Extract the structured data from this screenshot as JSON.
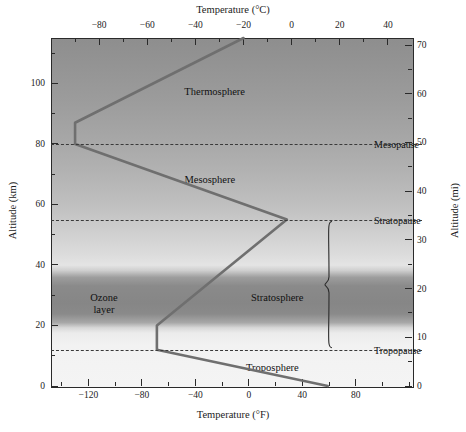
{
  "axes": {
    "top_title": "Temperature (°C)",
    "bottom_title": "Temperature (°F)",
    "left_title": "Altitude (km)",
    "right_title": "Altitude (mi)"
  },
  "ticks": {
    "top_celsius": [
      "−80",
      "−60",
      "−40",
      "−20",
      "0",
      "20",
      "40"
    ],
    "bottom_fahrenheit": [
      "−120",
      "−80",
      "−40",
      "0",
      "40",
      "80"
    ],
    "left_km": [
      "0",
      "20",
      "40",
      "60",
      "80",
      "100"
    ],
    "right_mi": [
      "0",
      "10",
      "20",
      "30",
      "40",
      "50",
      "60",
      "70"
    ]
  },
  "layers": [
    {
      "name": "Thermosphere"
    },
    {
      "name": "Mesosphere"
    },
    {
      "name": "Stratosphere"
    },
    {
      "name": "Troposphere"
    },
    {
      "name": "Ozone",
      "name2": "layer"
    }
  ],
  "boundaries": [
    {
      "name": "Mesopause",
      "altitude_km": 80
    },
    {
      "name": "Stratopause",
      "altitude_km": 55
    },
    {
      "name": "Tropopause",
      "altitude_km": 12
    }
  ],
  "chart_data": {
    "type": "line",
    "xlabel": "Temperature (°C)",
    "ylabel": "Altitude (km)",
    "xlabel_secondary": "Temperature (°F)",
    "ylabel_secondary": "Altitude (mi)",
    "xlim": [
      -100,
      50
    ],
    "ylim": [
      0,
      115
    ],
    "xlim_fahrenheit": [
      -148,
      122
    ],
    "ylim_mi": [
      0,
      71.5
    ],
    "grid": false,
    "legend": "none",
    "series": [
      {
        "name": "Temperature profile",
        "color": "#6f6f6f",
        "x": [
          15,
          -56,
          -56,
          -2,
          -90,
          -90,
          -20
        ],
        "y": [
          0,
          12,
          20,
          55,
          80,
          87,
          115
        ],
        "points_label": [
          "surface 15 °C at 0 km",
          "tropopause −56 °C at 12 km",
          "isothermal top −56 °C at 20 km",
          "stratopause −2 °C at 55 km",
          "mesopause −90 °C at 80 km",
          "lower thermosphere −90 °C at 87 km",
          "thermosphere −20 °C at 115 km"
        ]
      }
    ],
    "bands": [
      {
        "name": "Ozone layer",
        "y_from": 18,
        "y_to": 36,
        "color": "#868686"
      }
    ],
    "hlines": [
      {
        "label": "Mesopause",
        "y": 80,
        "style": "dashed"
      },
      {
        "label": "Stratopause",
        "y": 55,
        "style": "dashed"
      },
      {
        "label": "Tropopause",
        "y": 12,
        "style": "dashed"
      }
    ],
    "annotations": [
      {
        "text": "Thermosphere",
        "x": -32,
        "y": 97
      },
      {
        "text": "Mesosphere",
        "x": -34,
        "y": 68
      },
      {
        "text": "Stratosphere",
        "x": -6,
        "y": 29
      },
      {
        "text": "Troposphere",
        "x": -8,
        "y": 6
      },
      {
        "text": "Ozone layer",
        "x": -78,
        "y": 27
      }
    ],
    "brace": {
      "label": "Stratosphere",
      "y_from": 55,
      "y_to": 12
    }
  }
}
